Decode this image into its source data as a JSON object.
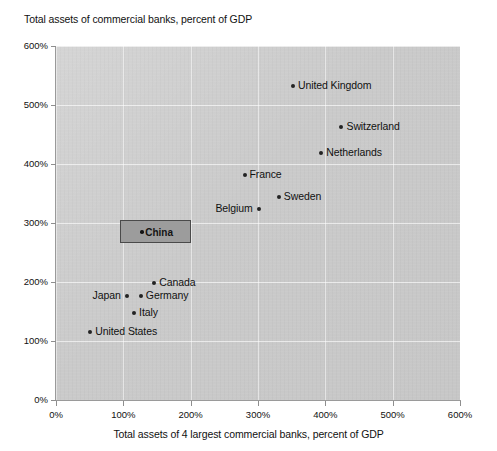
{
  "chart_data": {
    "type": "scatter",
    "title": "",
    "ylabel": "Total assets of commercial banks, percent of GDP",
    "xlabel": "Total assets of 4 largest commercial banks, percent of GDP",
    "xlim": [
      0,
      600
    ],
    "ylim": [
      0,
      600
    ],
    "grid": true,
    "legend": "none",
    "x_ticks": [
      "0%",
      "100%",
      "200%",
      "300%",
      "400%",
      "500%",
      "600%"
    ],
    "y_ticks": [
      "0%",
      "100%",
      "200%",
      "300%",
      "400%",
      "500%",
      "600%"
    ],
    "x_tick_values": [
      0,
      100,
      200,
      300,
      400,
      500,
      600
    ],
    "y_tick_values": [
      0,
      100,
      200,
      300,
      400,
      500,
      600
    ],
    "points": [
      {
        "name": "United Kingdom",
        "x": 352,
        "y": 533,
        "label_side": "right",
        "highlighted": false
      },
      {
        "name": "Switzerland",
        "x": 424,
        "y": 462,
        "label_side": "right",
        "highlighted": false
      },
      {
        "name": "Netherlands",
        "x": 394,
        "y": 419,
        "label_side": "right",
        "highlighted": false
      },
      {
        "name": "France",
        "x": 280,
        "y": 381,
        "label_side": "right",
        "highlighted": false
      },
      {
        "name": "Sweden",
        "x": 331,
        "y": 344,
        "label_side": "right",
        "highlighted": false
      },
      {
        "name": "Belgium",
        "x": 301,
        "y": 324,
        "label_side": "left",
        "highlighted": false
      },
      {
        "name": "China",
        "x": 128,
        "y": 281,
        "label_side": "right",
        "highlighted": true
      },
      {
        "name": "Canada",
        "x": 146,
        "y": 198,
        "label_side": "right",
        "highlighted": false
      },
      {
        "name": "Japan",
        "x": 105,
        "y": 176,
        "label_side": "left",
        "highlighted": false
      },
      {
        "name": "Germany",
        "x": 126,
        "y": 176,
        "label_side": "right",
        "highlighted": false
      },
      {
        "name": "Italy",
        "x": 116,
        "y": 147,
        "label_side": "right",
        "highlighted": false
      },
      {
        "name": "United States",
        "x": 51,
        "y": 115,
        "label_side": "right",
        "highlighted": false
      }
    ],
    "colors": {
      "plot_background": "#c9c9c9",
      "gridline": "#ffffff",
      "point": "#232323",
      "highlight_fill": "#9c9c9c",
      "highlight_border": "#4a4a4a",
      "page_background": "#ffffff",
      "text": "#111111"
    }
  }
}
